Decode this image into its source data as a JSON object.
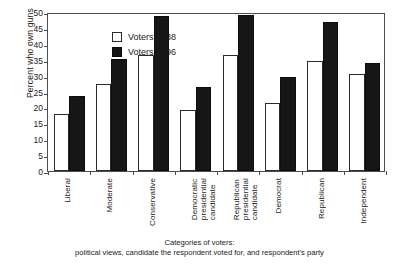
{
  "chart_data": {
    "type": "bar",
    "title": "",
    "subtitle": "",
    "xlabel": "Categories of voters:\npolitical views, candidate the respondent voted for, and respondent's party",
    "ylabel": "Percent who own guns",
    "ylim": [
      0,
      50
    ],
    "ytick_values": [
      0,
      5,
      10,
      15,
      20,
      25,
      30,
      35,
      40,
      45,
      50
    ],
    "ytick_labels": [
      "0",
      "5",
      "10",
      "15",
      "20",
      "25",
      "30",
      "35",
      "40",
      "45",
      "50"
    ],
    "grid": false,
    "legend_position": "upper-left-inside",
    "categories": [
      "Liberal",
      "Moderate",
      "Conservative",
      "Democratic\npresidential\ncandidate",
      "Republican\npresidential\ncandidate",
      "Democrat",
      "Republican",
      "Independent"
    ],
    "series": [
      {
        "name": "Voters 1988",
        "color": "#ffffff",
        "edge_color": "#2b2b2b",
        "values": [
          18.0,
          27.5,
          36.5,
          19.3,
          36.5,
          21.5,
          34.5,
          30.5
        ]
      },
      {
        "name": "Voters 1996",
        "color": "#161616",
        "edge_color": "#0d0d0d",
        "values": [
          23.7,
          35.3,
          48.7,
          26.5,
          49.0,
          29.5,
          47.0,
          34.0
        ]
      }
    ]
  },
  "legend": {
    "items": [
      {
        "label": "Voters 1988",
        "swatch": "white"
      },
      {
        "label": "Voters 1996",
        "swatch": "black"
      }
    ]
  },
  "caption": {
    "line1": "Categories of voters:",
    "line2": "political views, candidate the respondent voted for, and respondent's party"
  },
  "axis": {
    "y_title": "Percent who own guns"
  },
  "colors": {
    "series_1988": "#ffffff",
    "series_1996": "#161616",
    "axis": "#4d4d4d",
    "text": "#1a1a1a",
    "background": "#ffffff"
  }
}
